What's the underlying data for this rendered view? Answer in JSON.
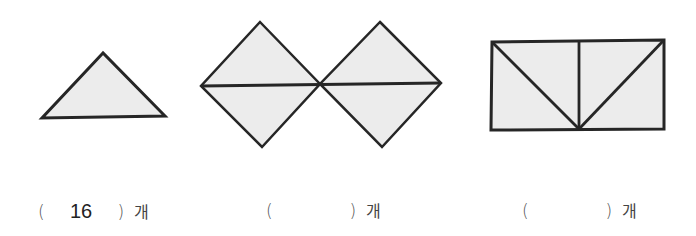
{
  "colors": {
    "fill": "#ececec",
    "stroke": "#262626"
  },
  "figures": [
    {
      "name": "single-triangle",
      "description": "one triangle piece"
    },
    {
      "name": "two-squares-split",
      "description": "two diamonds each split horizontally into two triangles"
    },
    {
      "name": "rectangle-split",
      "description": "rectangle split into four triangles"
    }
  ],
  "answers": [
    {
      "open": "(",
      "value": "16",
      "close": ")",
      "unit": "개"
    },
    {
      "open": "(",
      "value": "",
      "close": ")",
      "unit": "개"
    },
    {
      "open": "(",
      "value": "",
      "close": ")",
      "unit": "개"
    }
  ]
}
